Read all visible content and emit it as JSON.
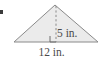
{
  "figure": {
    "type": "triangle-with-altitude",
    "background_color": "#ffffff",
    "fill_color": "#ebebeb",
    "stroke_color": "#8a8a8a",
    "dash_color": "#8a8a8a",
    "text_color": "#4a4a4a",
    "marker_color": "#3b3b3b",
    "height_label": "5 in.",
    "base_label": "12 in.",
    "apex": {
      "x": 55,
      "y": 5
    },
    "left_vertex": {
      "x": 14,
      "y": 42
    },
    "right_vertex": {
      "x": 98,
      "y": 42
    },
    "altitude_foot": {
      "x": 56,
      "y": 42
    },
    "right_angle_marker": {
      "x": 50,
      "y": 36,
      "size": 6
    }
  }
}
